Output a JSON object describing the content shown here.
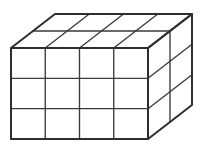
{
  "figure": {
    "name": "rectangular-prism-unit-grid",
    "title": "Rectangular prism divided into unit cubes",
    "shape": "cuboid",
    "projection": "oblique",
    "background_color": "#ffffff",
    "line_color": "#3a3a3a",
    "outline_color": "#2e2e2e",
    "fill_color": "#ffffff",
    "dimensions": {
      "width_units": 4,
      "height_units": 3,
      "depth_units": 2,
      "total_unit_cubes": 24
    },
    "faces": [
      {
        "id": "front",
        "label": "front-face",
        "columns": 4,
        "rows": 3,
        "cells": 12
      },
      {
        "id": "top",
        "label": "top-face",
        "columns": 4,
        "rows": 2,
        "cells": 8
      },
      {
        "id": "right",
        "label": "right-face",
        "columns": 2,
        "rows": 3,
        "cells": 6
      }
    ],
    "geometry": {
      "front_top_left": [
        11,
        48
      ],
      "front_top_right": [
        148,
        48
      ],
      "front_bottom_left": [
        11,
        139
      ],
      "front_bottom_right": [
        148,
        139
      ],
      "depth_offset_x": 44,
      "depth_offset_y": -34,
      "front_width_px": 137,
      "front_height_px": 91
    }
  }
}
